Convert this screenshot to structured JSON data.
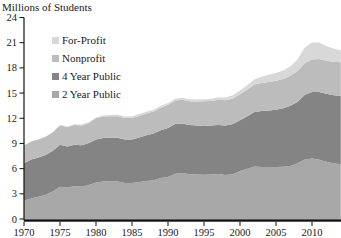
{
  "title": "Millions of Students",
  "chart_data": {
    "type": "area",
    "stacked": true,
    "title": "Millions of Students",
    "xlabel": "",
    "ylabel": "Millions of Students",
    "xlim": [
      1970,
      2014
    ],
    "ylim": [
      0,
      24
    ],
    "x_tick_labels": [
      "1970",
      "1975",
      "1980",
      "1985",
      "1990",
      "1995",
      "2000",
      "2005",
      "2010"
    ],
    "y_tick_labels": [
      "0",
      "3",
      "6",
      "9",
      "12",
      "15",
      "18",
      "21",
      "24"
    ],
    "grid": false,
    "legend_position": "upper-left",
    "legend_order": [
      "For-Profit",
      "Nonprofit",
      "4 Year Public",
      "2 Year Public"
    ],
    "years": [
      1970,
      1971,
      1972,
      1973,
      1974,
      1975,
      1976,
      1977,
      1978,
      1979,
      1980,
      1981,
      1982,
      1983,
      1984,
      1985,
      1986,
      1987,
      1988,
      1989,
      1990,
      1991,
      1992,
      1993,
      1994,
      1995,
      1996,
      1997,
      1998,
      1999,
      2000,
      2001,
      2002,
      2003,
      2004,
      2005,
      2006,
      2007,
      2008,
      2009,
      2010,
      2011,
      2012,
      2013,
      2014
    ],
    "series": [
      {
        "name": "2 Year Public",
        "color": "#a8a8a8",
        "values": [
          2.2,
          2.45,
          2.64,
          2.89,
          3.29,
          3.84,
          3.75,
          3.9,
          3.87,
          4.06,
          4.33,
          4.48,
          4.52,
          4.46,
          4.28,
          4.27,
          4.41,
          4.54,
          4.62,
          4.88,
          5.0,
          5.4,
          5.48,
          5.34,
          5.31,
          5.28,
          5.31,
          5.36,
          5.25,
          5.34,
          5.7,
          5.99,
          6.27,
          6.21,
          6.18,
          6.18,
          6.22,
          6.32,
          6.64,
          7.1,
          7.22,
          7.06,
          6.82,
          6.63,
          6.53
        ]
      },
      {
        "name": "4 Year Public",
        "color": "#848484",
        "values": [
          4.43,
          4.63,
          4.7,
          4.75,
          4.85,
          5.0,
          4.9,
          4.95,
          4.91,
          4.98,
          5.13,
          5.17,
          5.18,
          5.22,
          5.2,
          5.21,
          5.3,
          5.43,
          5.55,
          5.69,
          5.85,
          5.9,
          5.9,
          5.85,
          5.83,
          5.81,
          5.81,
          5.84,
          5.89,
          5.97,
          6.06,
          6.24,
          6.48,
          6.65,
          6.74,
          6.84,
          6.96,
          7.17,
          7.33,
          7.71,
          7.92,
          8.05,
          8.09,
          8.12,
          8.16
        ]
      },
      {
        "name": "Nonprofit",
        "color": "#bcbcbc",
        "values": [
          2.13,
          2.14,
          2.14,
          2.16,
          2.2,
          2.31,
          2.31,
          2.35,
          2.37,
          2.41,
          2.53,
          2.57,
          2.55,
          2.56,
          2.55,
          2.57,
          2.57,
          2.6,
          2.63,
          2.69,
          2.76,
          2.8,
          2.83,
          2.84,
          2.86,
          2.93,
          2.95,
          3.0,
          3.0,
          3.05,
          3.11,
          3.17,
          3.27,
          3.34,
          3.41,
          3.45,
          3.51,
          3.57,
          3.66,
          3.77,
          3.85,
          3.93,
          3.95,
          3.97,
          3.99
        ]
      },
      {
        "name": "For-Profit",
        "color": "#d8d8d8",
        "values": [
          0.02,
          0.02,
          0.03,
          0.03,
          0.04,
          0.07,
          0.07,
          0.08,
          0.09,
          0.1,
          0.11,
          0.13,
          0.15,
          0.17,
          0.19,
          0.2,
          0.22,
          0.21,
          0.22,
          0.22,
          0.21,
          0.22,
          0.23,
          0.23,
          0.24,
          0.24,
          0.26,
          0.29,
          0.32,
          0.37,
          0.45,
          0.53,
          0.63,
          0.75,
          0.85,
          0.91,
          1.01,
          1.13,
          1.4,
          1.85,
          2.02,
          1.97,
          1.73,
          1.56,
          1.42
        ]
      }
    ]
  }
}
